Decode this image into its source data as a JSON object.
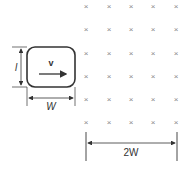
{
  "diagram": {
    "type": "physics-electromagnetic-induction",
    "loop": {
      "velocity_label": "v",
      "length_label": "l",
      "width_label": "W"
    },
    "field_region": {
      "symbol": "×",
      "direction": "into page",
      "rows": 6,
      "columns": 5,
      "width_label": "2W"
    },
    "colors": {
      "line": "#333333",
      "field_marks": "#888888",
      "background": "#ffffff"
    }
  }
}
